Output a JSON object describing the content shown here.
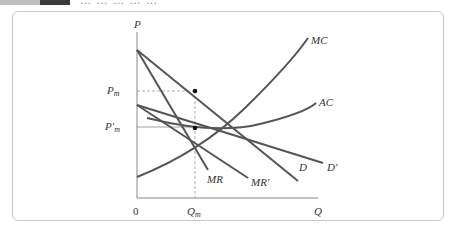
{
  "header": {
    "title": "… … … … …"
  },
  "diagram": {
    "axes": {
      "y_label": "P",
      "x_label": "Q",
      "origin": "0"
    },
    "price_labels": {
      "pm": "P",
      "pm_sub": "m",
      "pm_prime": "P′",
      "pm_prime_sub": "m"
    },
    "quantity_labels": {
      "qm": "Q",
      "qm_sub": "m"
    },
    "curves": {
      "mc": "MC",
      "ac": "AC",
      "d": "D",
      "d_prime": "D′",
      "mr": "MR",
      "mr_prime": "MR′"
    },
    "colors": {
      "curve": "#555555",
      "axis": "#888888",
      "dashed": "#999999",
      "point": "#111111",
      "frame": "#c9c9c9"
    }
  }
}
